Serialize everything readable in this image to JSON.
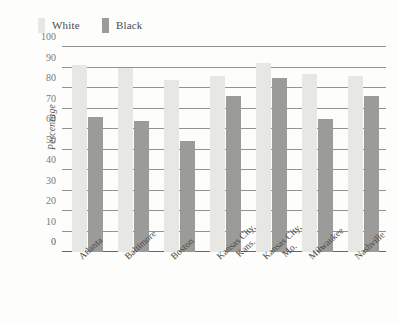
{
  "chart_data": {
    "type": "bar",
    "title": "",
    "xlabel": "",
    "ylabel": "Percentage",
    "ylim": [
      0,
      100
    ],
    "ytick_step": 10,
    "yticks": [
      "100",
      "90",
      "80",
      "70",
      "60",
      "50",
      "40",
      "30",
      "20",
      "10",
      "0"
    ],
    "grid": true,
    "legend_position": "top-left",
    "categories": [
      "Atlanta",
      "Baltimore",
      "Boston",
      "Kansas City, Kans.",
      "Kansas City, Mo.",
      "Milwaukee",
      "Nashville"
    ],
    "category_lines": [
      [
        "Atlanta",
        ""
      ],
      [
        "Baltimore",
        ""
      ],
      [
        "Boston",
        ""
      ],
      [
        "Kansas City,",
        "Kans."
      ],
      [
        "Kansas City,",
        "Mo."
      ],
      [
        "Milwaukee",
        ""
      ],
      [
        "Nashville",
        ""
      ]
    ],
    "series": [
      {
        "name": "White",
        "color": "#e7e7e4",
        "values": [
          91,
          90,
          84,
          86,
          92,
          87,
          86
        ]
      },
      {
        "name": "Black",
        "color": "#9b9b99",
        "values": [
          66,
          64,
          54,
          76,
          85,
          65,
          76
        ]
      }
    ]
  },
  "legend": {
    "entries": [
      {
        "label": "White",
        "color": "#e7e7e4"
      },
      {
        "label": "Black",
        "color": "#9b9b99"
      }
    ]
  }
}
